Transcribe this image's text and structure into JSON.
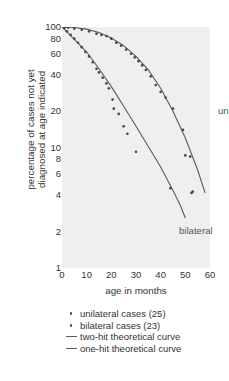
{
  "chart_data": {
    "type": "scatter",
    "title": "",
    "xlabel": "age in months",
    "ylabel": "percentage of cases not yet diagnosed at age indicated",
    "ylabel_line1": "percentage of cases not yet",
    "ylabel_line2": "diagnosed at age indicated",
    "yscale": "log",
    "ylim": [
      1,
      100
    ],
    "xlim": [
      0,
      60
    ],
    "grid": false,
    "legend_position": "below-axes",
    "xticks": [
      0,
      10,
      20,
      30,
      40,
      50,
      60
    ],
    "xtick_labels": [
      "0",
      "10",
      "20",
      "30",
      "40",
      "50",
      "60"
    ],
    "yticks": [
      100,
      80,
      60,
      40,
      20,
      10,
      8,
      6,
      4,
      2,
      1
    ],
    "ytick_labels": [
      "100",
      "80",
      "60",
      "40",
      "20",
      "10",
      "8",
      "6",
      "4",
      "2",
      "1"
    ],
    "annotations": [
      {
        "text": "unilateral",
        "x": 42,
        "y": 33
      },
      {
        "text": "bilateral",
        "x": 25,
        "y": 4.6
      }
    ],
    "legend": [
      {
        "label": "unilateral cases (25)",
        "marker": "dot"
      },
      {
        "label": "bilateral cases (23)",
        "marker": "dot"
      },
      {
        "label": "two-hit theoretical curve",
        "marker": "line"
      },
      {
        "label": "one-hit theoretical curve",
        "marker": "line"
      }
    ],
    "series": [
      {
        "name": "unilateral cases (25)",
        "marker": "dot",
        "points": [
          {
            "x": 1,
            "y": 100
          },
          {
            "x": 2.5,
            "y": 99
          },
          {
            "x": 5,
            "y": 97
          },
          {
            "x": 8,
            "y": 95
          },
          {
            "x": 11,
            "y": 92
          },
          {
            "x": 14,
            "y": 88
          },
          {
            "x": 16,
            "y": 86
          },
          {
            "x": 18,
            "y": 84
          },
          {
            "x": 20,
            "y": 80
          },
          {
            "x": 22,
            "y": 74
          },
          {
            "x": 24,
            "y": 70
          },
          {
            "x": 26,
            "y": 65
          },
          {
            "x": 28,
            "y": 60
          },
          {
            "x": 29.5,
            "y": 56
          },
          {
            "x": 31,
            "y": 52
          },
          {
            "x": 32.5,
            "y": 48
          },
          {
            "x": 34,
            "y": 44
          },
          {
            "x": 36,
            "y": 39
          },
          {
            "x": 38,
            "y": 33
          },
          {
            "x": 40,
            "y": 29
          },
          {
            "x": 42,
            "y": 26
          },
          {
            "x": 45,
            "y": 21
          },
          {
            "x": 49,
            "y": 14
          },
          {
            "x": 52,
            "y": 8.4
          },
          {
            "x": 53,
            "y": 4.3
          }
        ]
      },
      {
        "name": "bilateral cases (23)",
        "marker": "dot",
        "points": [
          {
            "x": 1,
            "y": 98
          },
          {
            "x": 2,
            "y": 92
          },
          {
            "x": 3.5,
            "y": 86
          },
          {
            "x": 5,
            "y": 80
          },
          {
            "x": 6.5,
            "y": 74
          },
          {
            "x": 8,
            "y": 68
          },
          {
            "x": 9.5,
            "y": 62
          },
          {
            "x": 11,
            "y": 57
          },
          {
            "x": 12.5,
            "y": 51
          },
          {
            "x": 14,
            "y": 45
          },
          {
            "x": 15,
            "y": 42
          },
          {
            "x": 16.5,
            "y": 38
          },
          {
            "x": 18,
            "y": 34
          },
          {
            "x": 19,
            "y": 31
          },
          {
            "x": 20.5,
            "y": 25
          },
          {
            "x": 21,
            "y": 21
          },
          {
            "x": 23,
            "y": 19
          },
          {
            "x": 25,
            "y": 15
          },
          {
            "x": 26.5,
            "y": 13
          },
          {
            "x": 30,
            "y": 9.2
          },
          {
            "x": 44,
            "y": 4.6
          },
          {
            "x": 50,
            "y": 8.6
          },
          {
            "x": 52.5,
            "y": 4.2
          }
        ]
      },
      {
        "name": "two-hit theoretical curve",
        "marker": "line",
        "points": [
          {
            "x": 0,
            "y": 100
          },
          {
            "x": 5,
            "y": 99
          },
          {
            "x": 10,
            "y": 96
          },
          {
            "x": 15,
            "y": 90
          },
          {
            "x": 20,
            "y": 81
          },
          {
            "x": 25,
            "y": 70
          },
          {
            "x": 30,
            "y": 57
          },
          {
            "x": 35,
            "y": 44
          },
          {
            "x": 40,
            "y": 31
          },
          {
            "x": 45,
            "y": 20
          },
          {
            "x": 50,
            "y": 12
          },
          {
            "x": 55,
            "y": 6.5
          },
          {
            "x": 58,
            "y": 4.2
          }
        ]
      },
      {
        "name": "one-hit theoretical curve",
        "marker": "line",
        "points": [
          {
            "x": 0,
            "y": 100
          },
          {
            "x": 5,
            "y": 79
          },
          {
            "x": 10,
            "y": 62
          },
          {
            "x": 15,
            "y": 45
          },
          {
            "x": 20,
            "y": 32
          },
          {
            "x": 25,
            "y": 22
          },
          {
            "x": 30,
            "y": 15
          },
          {
            "x": 35,
            "y": 10.2
          },
          {
            "x": 40,
            "y": 6.9
          },
          {
            "x": 45,
            "y": 4.4
          },
          {
            "x": 48,
            "y": 3.3
          },
          {
            "x": 50,
            "y": 2.6
          }
        ]
      }
    ],
    "colors": {
      "background": "#ffffff",
      "plot_background": "#efefef",
      "marker": "#4a4a4a",
      "curve": "#5a5a5a",
      "text": "#333333"
    }
  }
}
